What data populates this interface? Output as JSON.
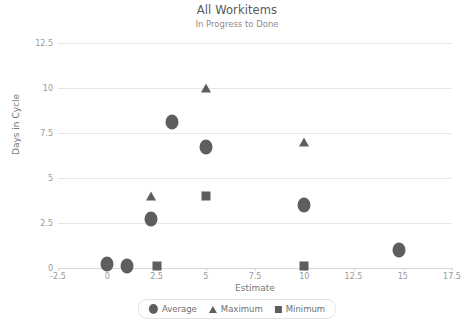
{
  "chart_data": {
    "type": "scatter",
    "title": "All Workitems",
    "subtitle": "In Progress to Done",
    "xlabel": "Estimate",
    "ylabel": "Days in Cycle",
    "xlim": [
      -2.5,
      17.5
    ],
    "ylim": [
      0,
      12.5
    ],
    "xticks": [
      -2.5,
      0,
      2.5,
      5,
      7.5,
      10,
      12.5,
      15,
      17.5
    ],
    "xticklabels": [
      "-2.5",
      "0",
      "2.5",
      "5",
      "7.5",
      "10",
      "12.5",
      "15",
      "17.5"
    ],
    "yticks": [
      0,
      2.5,
      5,
      7.5,
      10,
      12.5
    ],
    "yticklabels": [
      "0",
      "2.5",
      "5",
      "7.5",
      "10",
      "12.5"
    ],
    "grid": true,
    "legend_position": "bottom",
    "series": [
      {
        "name": "Average",
        "marker": "circle",
        "color": "#5e5e5e",
        "points": [
          {
            "x": 0.0,
            "y": 0.2
          },
          {
            "x": 1.0,
            "y": 0.1
          },
          {
            "x": 2.2,
            "y": 2.7
          },
          {
            "x": 3.3,
            "y": 8.1
          },
          {
            "x": 5.0,
            "y": 6.75
          },
          {
            "x": 10.0,
            "y": 3.5
          },
          {
            "x": 14.8,
            "y": 1.0
          }
        ]
      },
      {
        "name": "Maximum",
        "marker": "triangle",
        "color": "#5e5e5e",
        "points": [
          {
            "x": 2.2,
            "y": 4.0
          },
          {
            "x": 5.0,
            "y": 10.0
          },
          {
            "x": 10.0,
            "y": 7.0
          }
        ]
      },
      {
        "name": "Minimum",
        "marker": "square",
        "color": "#5e5e5e",
        "points": [
          {
            "x": 2.5,
            "y": 0.1
          },
          {
            "x": 5.0,
            "y": 4.0
          },
          {
            "x": 10.0,
            "y": 0.1
          }
        ]
      }
    ]
  },
  "legend": {
    "items": [
      {
        "label": "Average",
        "marker": "circle"
      },
      {
        "label": "Maximum",
        "marker": "triangle"
      },
      {
        "label": "Minimum",
        "marker": "square"
      }
    ]
  }
}
